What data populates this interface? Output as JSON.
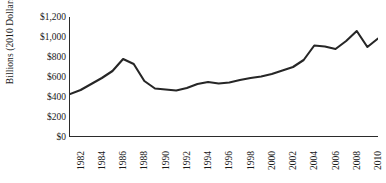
{
  "chart_data": {
    "type": "line",
    "title": "",
    "xlabel": "",
    "ylabel": "Billions (2010 Dollars)",
    "ylim": [
      0,
      1200
    ],
    "xlim": [
      1981,
      2010
    ],
    "grid": false,
    "legend": false,
    "y_ticks": [
      1200,
      1000,
      800,
      600,
      400,
      200,
      0
    ],
    "y_tick_labels": [
      "$1,200",
      "$1,000",
      "$800",
      "$600",
      "$400",
      "$200",
      "$0"
    ],
    "x_tick_labels": [
      "1982",
      "1984",
      "1986",
      "1988",
      "1990",
      "1992",
      "1994",
      "1996",
      "1998",
      "2000",
      "2002",
      "2004",
      "2006",
      "2008",
      "2010"
    ],
    "line_color": "#262626",
    "line_width": 2.1,
    "x": [
      1981,
      1982,
      1983,
      1984,
      1985,
      1986,
      1987,
      1988,
      1989,
      1990,
      1991,
      1992,
      1993,
      1994,
      1995,
      1996,
      1997,
      1998,
      1999,
      2000,
      2001,
      2002,
      2003,
      2004,
      2005,
      2006,
      2007,
      2008,
      2009,
      2010
    ],
    "values": [
      430,
      470,
      530,
      590,
      660,
      780,
      730,
      560,
      485,
      475,
      465,
      490,
      530,
      550,
      535,
      545,
      570,
      590,
      605,
      630,
      665,
      700,
      770,
      915,
      905,
      880,
      960,
      1060,
      900,
      985
    ],
    "series": [
      {
        "name": "Billions (2010 Dollars)",
        "values": [
          430,
          470,
          530,
          590,
          660,
          780,
          730,
          560,
          485,
          475,
          465,
          490,
          530,
          550,
          535,
          545,
          570,
          590,
          605,
          630,
          665,
          700,
          770,
          915,
          905,
          880,
          960,
          1060,
          900,
          985
        ]
      }
    ]
  },
  "axis": {
    "y_title": "Billions (2010 Dollars)"
  }
}
